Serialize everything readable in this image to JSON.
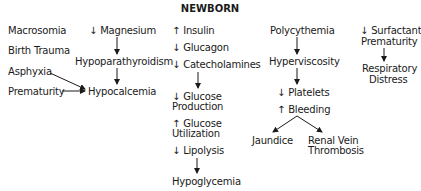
{
  "title": "NEWBORN",
  "column1": {
    "items": [
      "Macrosomia",
      "Birth Trauma",
      "Asphyxia",
      "Prematurity"
    ]
  },
  "column2": {
    "magnesium": "↓ Magnesium",
    "hypoparathyroidism": "Hypoparathyroidism",
    "hypocalcemia": "Hypocalcemia"
  },
  "column3": {
    "insulin": "↑ Insulin",
    "glucagon": "↓ Glucagon",
    "catecholamines": "↓ Catecholamines",
    "glucose_production_1": "↓ Glucose",
    "glucose_production_2": "Production",
    "glucose_utilization_1": "↑ Glucose",
    "glucose_utilization_2": "Utilization",
    "lipolysis": "↓ Lipolysis",
    "hypoglycemia": "Hypoglycemia"
  },
  "column4": {
    "polycythemia": "Polycythemia",
    "hyperviscosity": "Hyperviscosity",
    "platelets": "↓ Platelets",
    "bleeding": "↑ Bleeding",
    "jaundice": "Jaundice",
    "renal_vein_1": "Renal Vein",
    "renal_vein_2": "Thrombosis"
  },
  "column5": {
    "surfactant": "↓ Surfactant",
    "prematurity": "Prematurity",
    "respiratory_1": "Respiratory",
    "respiratory_2": "Distress"
  }
}
